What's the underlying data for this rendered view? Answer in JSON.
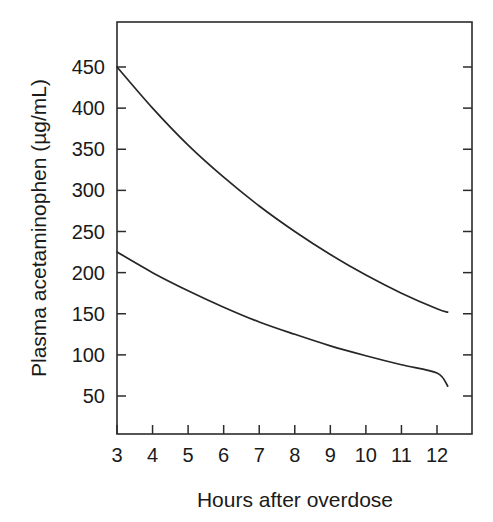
{
  "chart_data": {
    "type": "line",
    "title": "",
    "subtitle": "",
    "xlabel": "Hours after overdose",
    "ylabel": "Plasma acetaminophen (µg/mL)",
    "xlim": [
      3,
      12.35
    ],
    "ylim": [
      0,
      478
    ],
    "grid": false,
    "legend": "none",
    "background_color": "#ffffff",
    "line_color": "#262626",
    "axis_color": "#2b2b2b",
    "text_color": "#1a1a1a",
    "xticks": [
      3,
      4,
      5,
      6,
      7,
      8,
      9,
      10,
      11,
      12
    ],
    "xticklabels": [
      "3",
      "4",
      "5",
      "6",
      "7",
      "8",
      "9",
      "10",
      "11",
      "12"
    ],
    "yticks": [
      50,
      100,
      150,
      200,
      250,
      300,
      350,
      400,
      450
    ],
    "yticklabels": [
      "50",
      "100",
      "150",
      "200",
      "250",
      "300",
      "350",
      "400",
      "450"
    ],
    "x": [
      3,
      4,
      5,
      6,
      7,
      8,
      9,
      10,
      11,
      12,
      12.3
    ],
    "series": [
      {
        "name": "upper-treatment-line",
        "values": [
          450,
          400,
          355,
          316,
          281,
          250,
          222,
          197,
          175,
          156,
          152
        ]
      },
      {
        "name": "lower-treatment-line",
        "values": [
          225,
          200,
          178,
          158,
          140,
          125,
          111,
          99,
          88,
          78,
          62
        ]
      }
    ],
    "annotations": []
  },
  "figure": {
    "caption": "",
    "units": "µg/mL"
  }
}
